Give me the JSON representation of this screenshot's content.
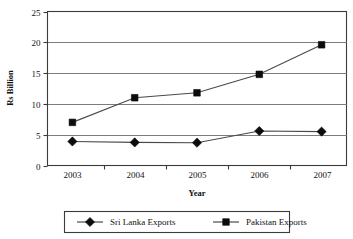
{
  "chart_data": {
    "type": "line",
    "title": "",
    "xlabel": "Year",
    "ylabel": "Rs Billion",
    "categories": [
      "2003",
      "2004",
      "2005",
      "2006",
      "2007"
    ],
    "x": [
      2003,
      2004,
      2005,
      2006,
      2007
    ],
    "xlim": [
      2002.6,
      2007.4
    ],
    "ylim": [
      0,
      25
    ],
    "yticks": [
      "0",
      "5",
      "10",
      "15",
      "20",
      "25"
    ],
    "ytick_values": [
      0,
      5,
      10,
      15,
      20,
      25
    ],
    "grid": "horizontal",
    "legend_position": "bottom",
    "series": [
      {
        "name": "Sri Lanka Exports",
        "marker": "diamond",
        "color": "#0c0c0c",
        "values": [
          3.9,
          3.75,
          3.7,
          5.6,
          5.5
        ]
      },
      {
        "name": "Pakistan Exports",
        "marker": "square",
        "color": "#0c0c0c",
        "values": [
          7.0,
          11.0,
          11.8,
          14.8,
          19.6
        ]
      }
    ]
  },
  "axes": {
    "y_title": "Rs Billion",
    "x_title": "Year",
    "y_tick_labels": [
      "25",
      "20",
      "15",
      "10",
      "5",
      "0"
    ],
    "x_tick_labels": [
      "2003",
      "2004",
      "2005",
      "2006",
      "2007"
    ]
  },
  "legend": {
    "entries": [
      {
        "label": "Sri Lanka Exports",
        "marker": "diamond-marker"
      },
      {
        "label": "Pakistan Exports",
        "marker": "square-marker"
      }
    ]
  }
}
